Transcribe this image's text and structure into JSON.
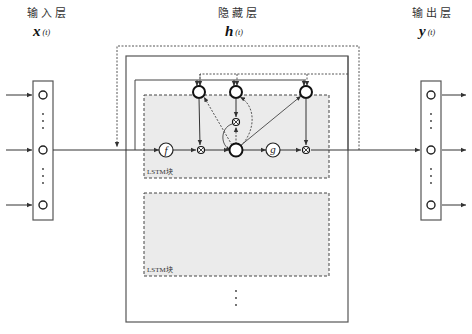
{
  "diagram": {
    "type": "RNN with LSTM hidden layer",
    "layers": {
      "input": {
        "title": "输入层",
        "var": "x",
        "sub": "(t)"
      },
      "hidden": {
        "title": "隐藏层",
        "var": "h",
        "sub": "(t)"
      },
      "output": {
        "title": "输出层",
        "var": "y",
        "sub": "(t)"
      }
    },
    "blocks": [
      {
        "label": "LSTM块",
        "gates": [
          "f",
          "g"
        ]
      },
      {
        "label": "LSTM块"
      }
    ],
    "ellipsis": "⋮",
    "colors": {
      "stroke": "#333333",
      "block_fill": "#ebebeb",
      "background": "#ffffff"
    }
  }
}
